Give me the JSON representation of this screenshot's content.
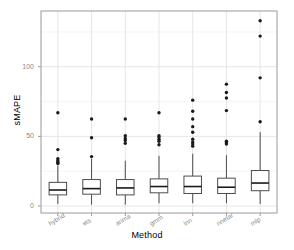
{
  "chart_data": {
    "type": "box",
    "title": "",
    "xlabel": "Method",
    "ylabel": "sMAPE",
    "ylim": [
      -5,
      140
    ],
    "yticks": [
      0,
      50,
      100
    ],
    "ytick_labels": [
      "0",
      "50",
      "100"
    ],
    "grid": true,
    "legend": "none",
    "categories": [
      "hybrid",
      "ets",
      "arima",
      "gmm",
      "lnn",
      "nnetar",
      "mlp"
    ],
    "series": [
      {
        "name": "hybrid",
        "min": 1.5,
        "q1": 8.0,
        "median": 11.5,
        "q3": 17.0,
        "max": 29.0,
        "outliers": [
          30.5,
          31.5,
          32.5,
          34.0,
          40.5,
          67.0
        ]
      },
      {
        "name": "ets",
        "min": 1.0,
        "q1": 8.5,
        "median": 12.5,
        "q3": 19.0,
        "max": 34.0,
        "outliers": [
          35.5,
          49.0,
          62.5
        ]
      },
      {
        "name": "arima",
        "min": 1.0,
        "q1": 8.0,
        "median": 13.0,
        "q3": 19.0,
        "max": 32.5,
        "outliers": [
          45.0,
          47.0,
          48.5,
          50.5,
          62.5
        ]
      },
      {
        "name": "gmm",
        "min": 2.0,
        "q1": 9.5,
        "median": 14.0,
        "q3": 19.5,
        "max": 36.0,
        "outliers": [
          44.0,
          46.5,
          48.0,
          49.5,
          50.5,
          67.0
        ]
      },
      {
        "name": "lnn",
        "min": 2.0,
        "q1": 9.0,
        "median": 14.0,
        "q3": 21.5,
        "max": 37.5,
        "outliers": [
          43.0,
          44.5,
          46.0,
          48.0,
          53.0,
          57.0,
          62.5,
          68.0,
          76.0
        ]
      },
      {
        "name": "nnetar",
        "min": 2.0,
        "q1": 9.0,
        "median": 13.5,
        "q3": 20.0,
        "max": 36.5,
        "outliers": [
          44.5,
          45.5,
          46.5,
          68.5,
          77.5,
          81.5,
          87.5
        ]
      },
      {
        "name": "mlp",
        "min": 1.5,
        "q1": 11.0,
        "median": 16.5,
        "q3": 25.5,
        "max": 53.0,
        "outliers": [
          60.5,
          92.0,
          122.0,
          133.0
        ]
      }
    ]
  },
  "axes": {
    "x_title": "Method",
    "y_title": "sMAPE",
    "y_tick_labels": [
      "0",
      "50",
      "100"
    ],
    "x_tick_labels": [
      "hybrid",
      "ets",
      "arima",
      "gmm",
      "lnn",
      "nnetar",
      "mlp"
    ]
  },
  "style": {
    "panel_background": "#ffffff",
    "panel_border": "#9a9a9a",
    "grid_color": "#e6e6e6",
    "box_stroke": "#4d4d4d",
    "median_color": "#1a1a1a",
    "outlier_color": "#1a1a1a",
    "tick_text_color": "#8a8a8a",
    "title_text_color": "#000000"
  }
}
